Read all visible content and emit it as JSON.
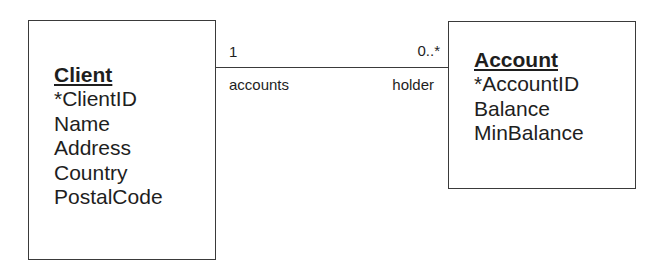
{
  "diagram": {
    "entities": [
      {
        "name": "Client",
        "attributes": [
          "*ClientID",
          "Name",
          "Address",
          "Country",
          "PostalCode"
        ]
      },
      {
        "name": "Account",
        "attributes": [
          "*AccountID",
          "Balance",
          "MinBalance"
        ]
      }
    ],
    "association": {
      "from": "Client",
      "to": "Account",
      "from_multiplicity": "1",
      "to_multiplicity": "0..*",
      "from_role": "accounts",
      "to_role": "holder"
    },
    "colors": {
      "line": "#3a3a3a",
      "text": "#1e1e1e",
      "background": "#ffffff"
    }
  }
}
